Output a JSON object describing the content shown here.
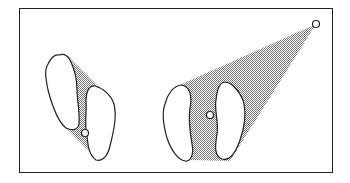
{
  "diagram": {
    "colors": {
      "border": "#222222",
      "shade": "#9a9a9a",
      "background": "#ffffff"
    },
    "panels": [
      {
        "name": "narrow-stance",
        "feet": 2,
        "point": "center point between feet",
        "shaded_region": "diagonal polygon between staggered feet"
      },
      {
        "name": "wide-stance",
        "feet": 2,
        "point": "center point between feet",
        "shaded_region": "triangle from feet to far upper-right point",
        "extra_point": "upper-right vertex"
      }
    ]
  }
}
